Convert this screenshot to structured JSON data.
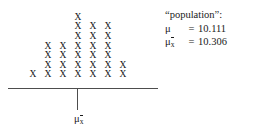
{
  "figure": {
    "name": "sampling-distribution-dotplot"
  },
  "chart_data": {
    "type": "bar",
    "title": "",
    "xlabel": "",
    "ylabel": "",
    "grid": false,
    "legend": null,
    "marker": "X",
    "categories": [
      "1",
      "2",
      "3",
      "4",
      "5",
      "6",
      "7"
    ],
    "values": [
      1,
      4,
      4,
      7,
      6,
      6,
      2
    ],
    "ylim": [
      0,
      7
    ],
    "annotations": {
      "population_label": "“population”:",
      "mu_symbol": "μ",
      "mu_equals": "=",
      "mu_value": "10.111",
      "mu_xbar_symbol": "μ",
      "mu_xbar_sub": "x",
      "mu_xbar_equals": "=",
      "mu_xbar_value": "10.306"
    },
    "axis": {
      "tick_label_symbol": "μ",
      "tick_label_sub": "x",
      "tick_position_category": "4"
    }
  },
  "colors": {
    "background": "#ffffff",
    "mark": "#202020",
    "axis": "#4d4d4d",
    "text": "#1a1a1a"
  }
}
